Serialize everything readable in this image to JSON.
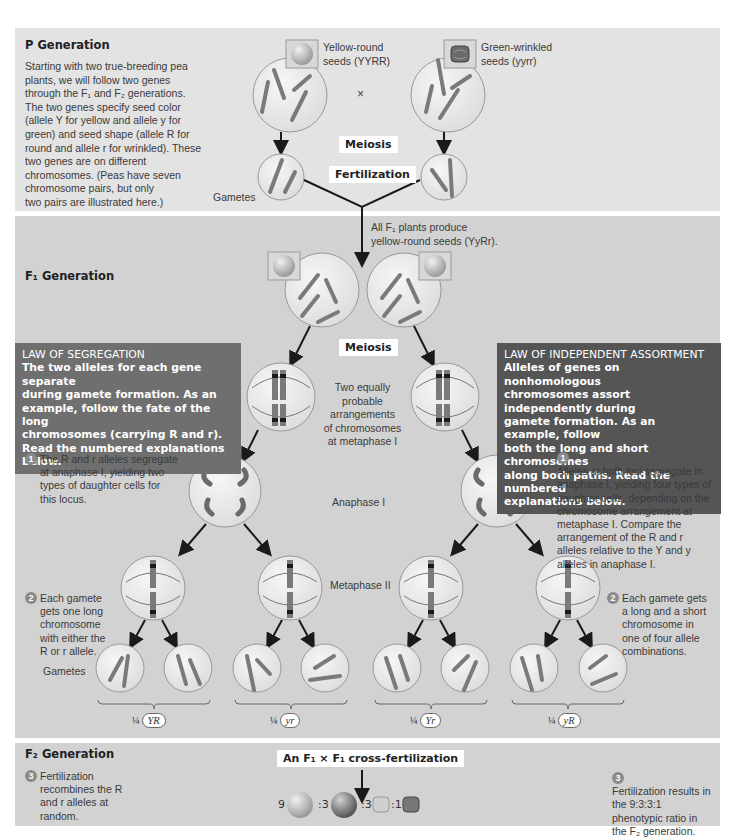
{
  "p_generation": {
    "title": "P Generation",
    "intro_lines": [
      "Starting with two true-breeding pea",
      "plants, we will follow two genes",
      "through the F₁ and F₂ generations.",
      "The two genes specify seed color",
      "(allele Y for yellow and allele y for",
      "green) and seed shape (allele R for",
      "round and allele r for wrinkled). These",
      "two genes are on different",
      "chromosomes. (Peas have seven",
      "chromosome pairs, but only",
      "two pairs are illustrated here.)"
    ],
    "parent_left": {
      "label_line1": "Yellow-round",
      "label_line2": "seeds (YYRR)",
      "seed_icon": "yellow-round-seed-icon",
      "alleles": [
        "Y",
        "R",
        "R",
        "Y"
      ]
    },
    "parent_right": {
      "label_line1": "Green-wrinkled",
      "label_line2": "seeds (yyrr)",
      "seed_icon": "green-wrinkled-seed-icon",
      "alleles": [
        "y",
        "r",
        "y",
        "r"
      ]
    },
    "cross_symbol": "×",
    "meiosis_label": "Meiosis",
    "fertilization_label": "Fertilization",
    "gametes_label": "Gametes",
    "gamete_left_alleles": [
      "R",
      "Y"
    ],
    "gamete_right_alleles": [
      "y",
      "r"
    ]
  },
  "f1_generation": {
    "title": "F₁ Generation",
    "note_line1": "All F₁ plants produce",
    "note_line2": "yellow-round seeds (YyRr).",
    "meiosis_label": "Meiosis",
    "metaphase1_label_lines": [
      "Two equally",
      "probable",
      "arrangements",
      "of chromosomes",
      "at metaphase I"
    ],
    "anaphase1_label": "Anaphase I",
    "metaphase2_label": "Metaphase II",
    "gametes_label": "Gametes",
    "law_segregation": {
      "heading": "LAW OF SEGREGATION",
      "body_lines": [
        "The two alleles for each gene separate",
        "during gamete formation. As an",
        "example, follow the fate of the long",
        "chromosomes (carrying R and r).",
        "Read the numbered explanations",
        "below."
      ]
    },
    "law_independent": {
      "heading": "LAW OF INDEPENDENT ASSORTMENT",
      "body_lines": [
        "Alleles of genes on nonhomologous",
        "chromosomes assort independently during",
        "gamete formation. As an example, follow",
        "both the long and short chromosomes",
        "along both paths. Read the numbered",
        "explanations below."
      ]
    },
    "left_steps": [
      {
        "number": "1",
        "lines": [
          "The R and r alleles segregate",
          "at anaphase I, yielding two",
          "types of daughter cells for",
          "this locus."
        ]
      },
      {
        "number": "2",
        "lines": [
          "Each gamete",
          "gets one long",
          "chromosome",
          "with either the",
          "R or r allele."
        ]
      }
    ],
    "right_steps": [
      {
        "number": "1",
        "lines": [
          "Alleles at both loci segregate in",
          "anaphase I, yielding four types of",
          "daughter cells, depending on the",
          "chromosome arrangement at",
          "metaphase I. Compare the",
          "arrangement of the R and r",
          "alleles relative to the Y and y",
          "alleles in anaphase I."
        ]
      },
      {
        "number": "2",
        "lines": [
          "Each gamete gets",
          "a long and a short",
          "chromosome in",
          "one of four allele",
          "combinations."
        ]
      }
    ],
    "gamete_fractions": [
      {
        "fraction": "¼",
        "genotype": "YR"
      },
      {
        "fraction": "¼",
        "genotype": "yr"
      },
      {
        "fraction": "¼",
        "genotype": "Yr"
      },
      {
        "fraction": "¼",
        "genotype": "yR"
      }
    ],
    "metaphase1_left_alleles": {
      "top_left": "R",
      "top_right": "r",
      "bottom_left": "Y",
      "bottom_right": "y"
    },
    "metaphase1_right_alleles": {
      "top_left": "r",
      "top_right": "R",
      "bottom_left": "Y",
      "bottom_right": "y"
    }
  },
  "f2_generation": {
    "title": "F₂ Generation",
    "cross_label": "An F₁ × F₁ cross-fertilization",
    "left_step": {
      "number": "3",
      "lines": [
        "Fertilization",
        "recombines the R",
        "and r alleles at",
        "random."
      ]
    },
    "right_step": {
      "number": "3",
      "lines": [
        "Fertilization results in",
        "the 9:3:3:1",
        "phenotypic ratio in",
        "the F₂ generation."
      ]
    },
    "ratio": [
      {
        "count": "9",
        "phenotype": "yellow-round",
        "icon": "yellow-round-seed-icon"
      },
      {
        "count": ":3",
        "phenotype": "green-round",
        "icon": "green-round-seed-icon"
      },
      {
        "count": ":3",
        "phenotype": "yellow-wrinkled",
        "icon": "yellow-wrinkled-seed-icon"
      },
      {
        "count": ":1",
        "phenotype": "green-wrinkled",
        "icon": "green-wrinkled-seed-icon"
      }
    ]
  },
  "colors": {
    "p_panel_bg": "#e3e3e3",
    "f_panel_bg": "#d2d2d2",
    "law_segregation_bg": "#6f6f6f",
    "law_independent_bg": "#555555",
    "cell_fill": "#ececec",
    "chromosome": "#7a7a7a",
    "arrow": "#1a1a1a"
  }
}
